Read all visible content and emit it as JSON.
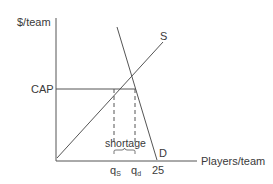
{
  "diagram": {
    "y_axis_label": "$/team",
    "x_axis_label": "Players/team",
    "cap_label": "CAP",
    "supply_label": "S",
    "demand_label": "D",
    "shortage_label": "shortage",
    "x_ticks": {
      "qs_base": "q",
      "qs_sub": "S",
      "qd_base": "q",
      "qd_sub": "d",
      "max_value": "25"
    },
    "colors": {
      "line": "#555555",
      "text": "#3a3a3a"
    }
  }
}
